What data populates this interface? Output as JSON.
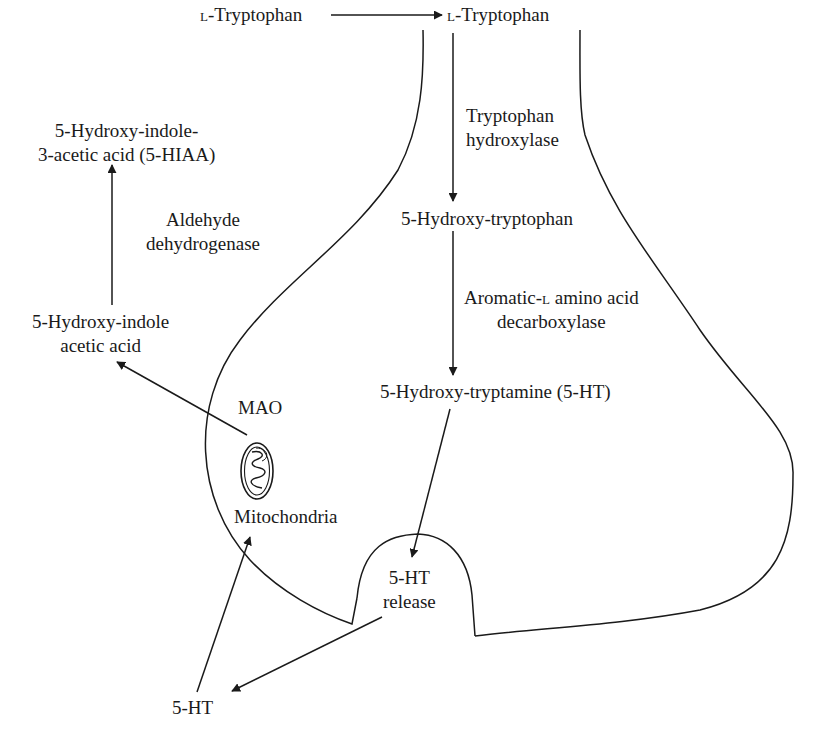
{
  "diagram": {
    "type": "biochemical-pathway",
    "line_color": "#1a1a1a",
    "background": "#ffffff"
  },
  "labels": {
    "trp_outside": {
      "prefix": "l",
      "text": "-Tryptophan"
    },
    "trp_inside": {
      "prefix": "l",
      "text": "-Tryptophan"
    },
    "enzyme_trp_hydroxylase": [
      "Tryptophan",
      "hydroxylase"
    ],
    "htp": "5-Hydroxy-tryptophan",
    "enzyme_aadc": {
      "line1_a": "Aromatic-",
      "line1_sc": "l",
      "line1_b": " amino acid",
      "line2": "decarboxylase"
    },
    "ht": "5-Hydroxy-tryptamine (5-HT)",
    "release": [
      "5-HT",
      "release"
    ],
    "ht_synapse": "5-HT",
    "mitochondria": "Mitochondria",
    "mao": "MAO",
    "hia": [
      "5-Hydroxy-indole",
      "acetic acid"
    ],
    "enzyme_aldh": [
      "Aldehyde",
      "dehydrogenase"
    ],
    "hiaa": [
      "5-Hydroxy-indole-",
      "3-acetic acid (5-HIAA)"
    ]
  },
  "nodes": [
    {
      "id": "trp_out",
      "label": "L-Tryptophan",
      "location": "extracellular"
    },
    {
      "id": "trp_in",
      "label": "L-Tryptophan",
      "location": "terminal"
    },
    {
      "id": "htp",
      "label": "5-Hydroxy-tryptophan",
      "location": "terminal"
    },
    {
      "id": "ht",
      "label": "5-Hydroxy-tryptamine (5-HT)",
      "location": "terminal"
    },
    {
      "id": "release",
      "label": "5-HT release",
      "location": "release site"
    },
    {
      "id": "ht_syn",
      "label": "5-HT",
      "location": "synaptic cleft"
    },
    {
      "id": "mito",
      "label": "Mitochondria",
      "location": "terminal"
    },
    {
      "id": "hia",
      "label": "5-Hydroxy-indole acetic acid",
      "location": "outside"
    },
    {
      "id": "hiaa",
      "label": "5-Hydroxy-indole-3-acetic acid (5-HIAA)",
      "location": "outside"
    }
  ],
  "edges": [
    {
      "from": "trp_out",
      "to": "trp_in",
      "enzyme": ""
    },
    {
      "from": "trp_in",
      "to": "htp",
      "enzyme": "Tryptophan hydroxylase"
    },
    {
      "from": "htp",
      "to": "ht",
      "enzyme": "Aromatic-L amino acid decarboxylase"
    },
    {
      "from": "ht",
      "to": "release",
      "enzyme": ""
    },
    {
      "from": "release",
      "to": "ht_syn",
      "enzyme": ""
    },
    {
      "from": "ht_syn",
      "to": "mito",
      "enzyme": ""
    },
    {
      "from": "mito",
      "to": "hia",
      "enzyme": "MAO"
    },
    {
      "from": "hia",
      "to": "hiaa",
      "enzyme": "Aldehyde dehydrogenase"
    }
  ]
}
